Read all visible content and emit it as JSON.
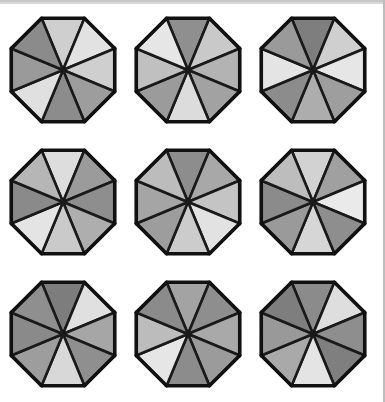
{
  "figure": {
    "background_color": "#ffffff",
    "stroke_color": "#1a1a1a",
    "scan_bar_color": "#d9d9d9",
    "page_edge_color": "#bdbdbd",
    "rows": 3,
    "columns": 3,
    "wedges_per_octagon": 8,
    "palette": {
      "lightest": "#e8e8e8",
      "light": "#d8d8d8",
      "light_mid": "#c4c4c4",
      "mid": "#b0b0b0",
      "mid_dark": "#9a9a9a",
      "dark": "#8a8a8a",
      "darker": "#7c7c7c",
      "darkest": "#6e6e6e"
    }
  },
  "octagons": [
    {
      "name": "octagon-r1c1",
      "row": 1,
      "column": 1,
      "wedge_fills": [
        "#cfcfcf",
        "#e2e2e2",
        "#cfcfcf",
        "#9d9d9d",
        "#8c8c8c",
        "#e0e0e0",
        "#9a9a9a",
        "#8b8b8b"
      ]
    },
    {
      "name": "octagon-r1c2",
      "row": 1,
      "column": 2,
      "wedge_fills": [
        "#8f8f8f",
        "#c9c9c9",
        "#b3b3b3",
        "#a2a2a2",
        "#dcdcdc",
        "#9b9b9b",
        "#c0c0c0",
        "#e6e6e6"
      ]
    },
    {
      "name": "octagon-r1c3",
      "row": 1,
      "column": 3,
      "wedge_fills": [
        "#7e7e7e",
        "#cfcfcf",
        "#e6e6e6",
        "#9e9e9e",
        "#adadad",
        "#8c8c8c",
        "#e4e4e4",
        "#9a9a9a"
      ]
    },
    {
      "name": "octagon-r2c1",
      "row": 2,
      "column": 1,
      "wedge_fills": [
        "#dddddd",
        "#9b9b9b",
        "#8e8e8e",
        "#aeaeae",
        "#cacaca",
        "#e4e4e4",
        "#8a8a8a",
        "#b6b6b6"
      ]
    },
    {
      "name": "octagon-r2c2",
      "row": 2,
      "column": 2,
      "wedge_fills": [
        "#8d8d8d",
        "#a8a8a8",
        "#c4c4c4",
        "#e2e2e2",
        "#cccccc",
        "#9d9d9d",
        "#a5a5a5",
        "#bcbcbc"
      ]
    },
    {
      "name": "octagon-r2c3",
      "row": 2,
      "column": 3,
      "wedge_fills": [
        "#d2d2d2",
        "#a0a0a0",
        "#eaeaea",
        "#8e8e8e",
        "#d6d6d6",
        "#9a9a9a",
        "#8b8b8b",
        "#bdbdbd"
      ]
    },
    {
      "name": "octagon-r3c1",
      "row": 3,
      "column": 1,
      "wedge_fills": [
        "#7d7d7d",
        "#e0e0e0",
        "#a6a6a6",
        "#8f8f8f",
        "#d8d8d8",
        "#9d9d9d",
        "#8a8a8a",
        "#8f8f8f"
      ]
    },
    {
      "name": "octagon-r3c2",
      "row": 3,
      "column": 2,
      "wedge_fills": [
        "#a3a3a3",
        "#8e8e8e",
        "#a9a9a9",
        "#9b9b9b",
        "#8c8c8c",
        "#e6e6e6",
        "#bcbcbc",
        "#8b8b8b"
      ]
    },
    {
      "name": "octagon-r3c3",
      "row": 3,
      "column": 3,
      "wedge_fills": [
        "#8b8b8b",
        "#dedede",
        "#8e8e8e",
        "#7f7f7f",
        "#e4e4e4",
        "#a9a9a9",
        "#999999",
        "#7e7e7e"
      ]
    }
  ]
}
